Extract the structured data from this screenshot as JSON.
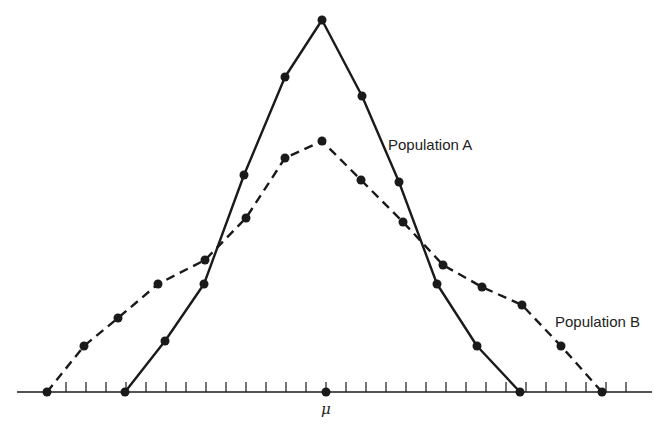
{
  "chart_data": {
    "type": "line",
    "title": "",
    "xlabel": "",
    "ylabel": "",
    "x_tick_label_center": "μ",
    "grid": false,
    "legend": "inline labels",
    "axis": {
      "baseline_y_px": 392,
      "x_start_px": 17,
      "x_end_px": 652,
      "tick_spacing_px": 20,
      "tick_start_px": 66,
      "tick_count": 30,
      "tick_height_px": 10
    },
    "series": [
      {
        "name": "Population A",
        "style": "solid",
        "label_pos": [
          388,
          136
        ],
        "points_px": [
          [
            125,
            392
          ],
          [
            165,
            341
          ],
          [
            204,
            284
          ],
          [
            244,
            175
          ],
          [
            285,
            77
          ],
          [
            322,
            20
          ],
          [
            362,
            96
          ],
          [
            399,
            182
          ],
          [
            437,
            284
          ],
          [
            477,
            346
          ],
          [
            520,
            392
          ]
        ],
        "values": [
          0,
          51,
          108,
          217,
          315,
          372,
          296,
          210,
          108,
          46,
          0
        ]
      },
      {
        "name": "Population B",
        "style": "dashed",
        "label_pos": [
          555,
          313
        ],
        "points_px": [
          [
            47,
            392
          ],
          [
            84,
            346
          ],
          [
            118,
            318
          ],
          [
            158,
            284
          ],
          [
            205,
            260
          ],
          [
            246,
            218
          ],
          [
            285,
            158
          ],
          [
            322,
            141
          ],
          [
            361,
            180
          ],
          [
            403,
            222
          ],
          [
            443,
            265
          ],
          [
            482,
            287
          ],
          [
            522,
            305
          ],
          [
            561,
            346
          ],
          [
            602,
            392
          ]
        ],
        "values": [
          0,
          46,
          74,
          108,
          132,
          174,
          234,
          251,
          212,
          170,
          127,
          105,
          87,
          46,
          0
        ]
      }
    ],
    "mean_marker_px": [
      326,
      392
    ],
    "ylim": [
      0,
      380
    ]
  },
  "labels": {
    "population_a": "Population A",
    "population_b": "Population B",
    "mu": "μ"
  },
  "colors": {
    "line": "#1a1a1a",
    "background": "#ffffff"
  }
}
